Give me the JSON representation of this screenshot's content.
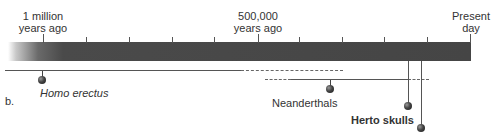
{
  "diagram": {
    "panel_label": "b.",
    "timeline": {
      "labels": [
        {
          "line1": "1 million",
          "line2": "years ago"
        },
        {
          "line1": "500,000",
          "line2": "years ago"
        },
        {
          "line1": "Present",
          "line2": "day"
        }
      ],
      "tick_count": 10,
      "tick_interval_years": 100000
    },
    "species": [
      {
        "name": "Homo erectus",
        "style": "italic"
      },
      {
        "name": "Neanderthals",
        "style": "normal"
      },
      {
        "name": "Herto skulls",
        "style": "bold"
      }
    ],
    "colors": {
      "bar": "#454545",
      "lines": "#555555",
      "text": "#333333"
    }
  }
}
